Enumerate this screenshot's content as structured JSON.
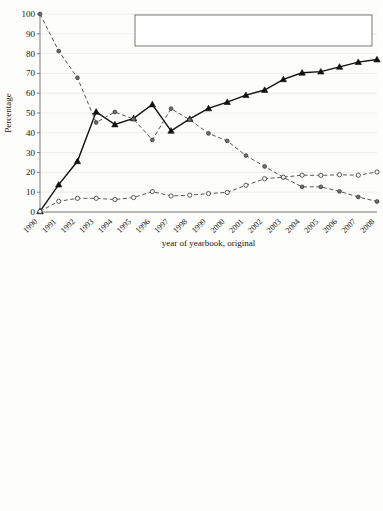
{
  "figure_top": {
    "ylabel": "Percentage",
    "xlabel": "year of yearbook, original",
    "legend": [
      {
        "label": "local official %",
        "style": "solid-triangle"
      },
      {
        "label": "outside official %",
        "style": "dashed-dot"
      },
      {
        "label": "unknown %",
        "style": "dashed-circle"
      }
    ]
  },
  "figure_bottom": {
    "ylabel": "%"
  },
  "chart_data": [
    {
      "type": "line",
      "title": "",
      "xlabel": "year of yearbook, original",
      "ylabel": "Percentage",
      "ylim": [
        0,
        100
      ],
      "yticks": [
        0,
        10,
        20,
        30,
        40,
        50,
        60,
        70,
        80,
        90,
        100
      ],
      "grid": true,
      "legend_position": "top-center",
      "categories": [
        "1990",
        "1991",
        "1992",
        "1993",
        "1994",
        "1995",
        "1996",
        "1997",
        "1998",
        "1999",
        "2000",
        "2001",
        "2002",
        "2003",
        "2004",
        "2005",
        "2006",
        "2007",
        "2008"
      ],
      "series": [
        {
          "name": "local official %",
          "marker": "triangle",
          "line": "solid",
          "values": [
            0.3,
            13.8,
            25.6,
            50.6,
            44.2,
            47.3,
            54.3,
            41.0,
            47.0,
            52.3,
            55.5,
            59.0,
            61.6,
            67.0,
            70.3,
            70.9,
            73.3,
            75.7,
            77.0
          ]
        },
        {
          "name": "outside official %",
          "marker": "dot",
          "line": "dashed",
          "values": [
            100.0,
            81.3,
            67.8,
            45.2,
            50.5,
            46.9,
            36.4,
            52.2,
            46.6,
            39.7,
            35.9,
            28.5,
            23.0,
            17.5,
            12.7,
            12.7,
            10.4,
            7.6,
            5.3
          ]
        },
        {
          "name": "unknown %",
          "marker": "circle",
          "line": "dashed",
          "values": [
            0.3,
            5.4,
            6.9,
            6.9,
            6.3,
            7.3,
            10.3,
            8.1,
            8.5,
            9.3,
            9.9,
            13.5,
            16.8,
            17.6,
            18.6,
            18.5,
            18.8,
            18.6,
            20.2
          ]
        }
      ]
    },
    {
      "type": "boxplot",
      "title": "",
      "xlabel": "",
      "ylabel": "%",
      "ylim": [
        38,
        101
      ],
      "yticks": [
        40,
        45,
        50,
        55,
        60,
        65,
        70,
        75,
        80,
        85,
        90,
        95,
        100
      ],
      "grid": true,
      "categories": [
        "1993",
        "1994",
        "1995",
        "1996",
        "1997",
        "1998",
        "1999",
        "2000",
        "2001",
        "2002",
        "2003",
        "2004",
        "2005",
        "2006",
        "2007",
        "2008"
      ],
      "boxes": [
        {
          "year": "1993",
          "whisker_low": 82.9,
          "q1": 92.5,
          "median": 96.5,
          "q3": 98.8,
          "whisker_high": 100.0,
          "outliers": []
        },
        {
          "year": "1994",
          "whisker_low": 79.8,
          "q1": 90.1,
          "median": 95.5,
          "q3": 97.5,
          "whisker_high": 100.0,
          "outliers": [
            51.1
          ]
        },
        {
          "year": "1995",
          "whisker_low": 78.3,
          "q1": 89.6,
          "median": 94.8,
          "q3": 98.5,
          "whisker_high": 100.0,
          "outliers": [
            54.6
          ]
        },
        {
          "year": "1996",
          "whisker_low": 78.1,
          "q1": 88.3,
          "median": 93.2,
          "q3": 96.4,
          "whisker_high": 100.0,
          "outliers": [
            74.9,
            54.6
          ]
        },
        {
          "year": "1997",
          "whisker_low": 78.4,
          "q1": 88.3,
          "median": 91.5,
          "q3": 96.1,
          "whisker_high": 100.0,
          "outliers": [
            73.6,
            56.0
          ]
        },
        {
          "year": "1998",
          "whisker_low": 75.2,
          "q1": 87.2,
          "median": 91.0,
          "q3": 95.4,
          "whisker_high": 100.0,
          "outliers": [
            58.0
          ]
        },
        {
          "year": "1999",
          "whisker_low": 75.2,
          "q1": 86.4,
          "median": 91.2,
          "q3": 94.5,
          "whisker_high": 100.0,
          "outliers": [
            63.9
          ]
        },
        {
          "year": "2000",
          "whisker_low": 77.4,
          "q1": 88.4,
          "median": 91.8,
          "q3": 96.1,
          "whisker_high": 100.0,
          "outliers": [
            74.5,
            66.4,
            56.2
          ]
        },
        {
          "year": "2001",
          "whisker_low": 74.3,
          "q1": 86.2,
          "median": 91.1,
          "q3": 94.9,
          "whisker_high": 100.0,
          "outliers": [
            68.8,
            58.9
          ]
        },
        {
          "year": "2002",
          "whisker_low": 72.4,
          "q1": 84.2,
          "median": 88.8,
          "q3": 93.1,
          "whisker_high": 100.0,
          "outliers": [
            70.8,
            68.5,
            63.6
          ]
        },
        {
          "year": "2003",
          "whisker_low": 68.8,
          "q1": 81.4,
          "median": 86.4,
          "q3": 90.8,
          "whisker_high": 100.0,
          "outliers": [
            65.1,
            59.5
          ]
        },
        {
          "year": "2004",
          "whisker_low": 66.9,
          "q1": 78.8,
          "median": 83.4,
          "q3": 90.1,
          "whisker_high": 98.6,
          "outliers": [
            59.7,
            56.5,
            49.8,
            47.8,
            45.3
          ]
        },
        {
          "year": "2005",
          "whisker_low": 64.2,
          "q1": 78.9,
          "median": 83.1,
          "q3": 89.3,
          "whisker_high": 100.0,
          "outliers": [
            62.3,
            52.9,
            50.3,
            46.2
          ]
        },
        {
          "year": "2006",
          "whisker_low": 63.9,
          "q1": 78.9,
          "median": 82.8,
          "q3": 88.9,
          "whisker_high": 100.0,
          "outliers": [
            57.3,
            51.1,
            48.8
          ]
        },
        {
          "year": "2007",
          "whisker_low": 65.3,
          "q1": 78.8,
          "median": 84.3,
          "q3": 88.7,
          "whisker_high": 98.7,
          "outliers": [
            61.0,
            54.1,
            52.0
          ]
        },
        {
          "year": "2008",
          "whisker_low": 63.8,
          "q1": 78.4,
          "median": 83.8,
          "q3": 87.6,
          "whisker_high": 96.3,
          "outliers": [
            62.1,
            59.3,
            55.3
          ]
        }
      ]
    }
  ]
}
